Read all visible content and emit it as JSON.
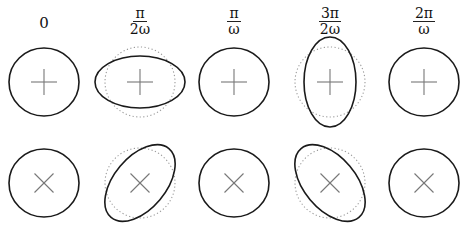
{
  "figure": {
    "time_labels": [
      {
        "plain": "0"
      },
      {
        "num": "π",
        "den": "2ω"
      },
      {
        "num": "π",
        "den": "ω"
      },
      {
        "num": "3π",
        "den": "2ω"
      },
      {
        "num": "2π",
        "den": "ω"
      }
    ],
    "rows": [
      {
        "polarization": "plus",
        "marker": "plus-icon",
        "shapes": [
          {
            "stretch_axis": "none",
            "deformation": 0
          },
          {
            "stretch_axis": "horizontal",
            "deformation": 1
          },
          {
            "stretch_axis": "none",
            "deformation": 0
          },
          {
            "stretch_axis": "vertical",
            "deformation": 1
          },
          {
            "stretch_axis": "none",
            "deformation": 0
          }
        ]
      },
      {
        "polarization": "cross",
        "marker": "cross-icon",
        "shapes": [
          {
            "stretch_axis": "none",
            "deformation": 0
          },
          {
            "stretch_axis": "diagonal-up",
            "deformation": 1
          },
          {
            "stretch_axis": "none",
            "deformation": 0
          },
          {
            "stretch_axis": "diagonal-down",
            "deformation": 1
          },
          {
            "stretch_axis": "none",
            "deformation": 0
          }
        ]
      }
    ],
    "colors": {
      "outline": "#1a1a1a",
      "reference_circle": "#9a9a9a",
      "marker": "#777777"
    }
  }
}
